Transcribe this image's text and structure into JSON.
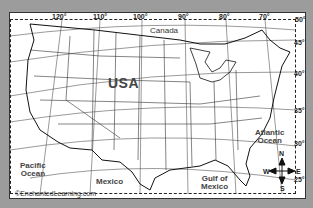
{
  "header_fragment": "...",
  "map": {
    "title": "USA",
    "labels": {
      "country_main": "USA",
      "north": "Canada",
      "south": "Mexico",
      "pacific": [
        "Pacific",
        "Ocean"
      ],
      "atlantic": [
        "Atlantic",
        "Ocean"
      ],
      "gulf": [
        "Gulf of",
        "Mexico"
      ]
    },
    "longitudes": [
      "120°",
      "110°",
      "100°",
      "90°",
      "80°",
      "70°"
    ],
    "latitudes": [
      "50°",
      "45°",
      "40°",
      "35°",
      "30°",
      "25°"
    ],
    "compass": {
      "n": "N",
      "s": "S",
      "e": "E",
      "w": "W"
    },
    "credit": "©EnchantedLearning.com"
  },
  "colors": {
    "background": "#9c9c9c",
    "map_fill": "#ffffff",
    "lines": "#222222",
    "text": "#333333"
  }
}
